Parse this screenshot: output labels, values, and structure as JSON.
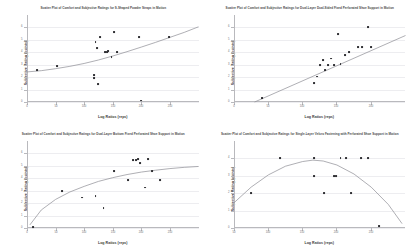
{
  "figure": {
    "layout": "2x2-grid",
    "background_color": "#ffffff",
    "marker_color": "#2f2f33",
    "curve_color": "#8d8d93",
    "gridline_color": "#ededf0",
    "axis_color": "#b9b9bd"
  },
  "chart_data": [
    {
      "type": "scatter",
      "panel": "top-left",
      "title": "Scatter Plot of Comfort and Subjective Ratings for S-Shaped Powder Straps in Motion",
      "xlabel": "Log Ratios (reps)",
      "ylabel": "Subjective Rating (points)",
      "xlim": [
        0,
        300
      ],
      "ylim": [
        0,
        7
      ],
      "xticks": [
        0,
        50,
        100,
        150,
        200,
        250
      ],
      "xticklabels": [
        "0",
        "50",
        "100",
        "150",
        "200",
        "250"
      ],
      "yticks": [
        0,
        1,
        2,
        3,
        4,
        5,
        6
      ],
      "yticklabels": [
        "0",
        "1",
        "2",
        "3",
        "4",
        "5",
        "6"
      ],
      "grid": true,
      "legend": "none",
      "x": [
        18,
        52,
        118,
        118,
        120,
        122,
        124,
        128,
        136,
        140,
        142,
        148,
        152,
        158,
        196,
        200,
        248
      ],
      "y": [
        2.55,
        2.9,
        2.2,
        1.9,
        4.8,
        4.35,
        1.45,
        5.2,
        4.05,
        4.05,
        4.1,
        3.65,
        5.6,
        4.05,
        5.25,
        0.12,
        5.25
      ],
      "fit": {
        "kind": "exponential",
        "points": [
          [
            0,
            2.42
          ],
          [
            25,
            2.52
          ],
          [
            50,
            2.68
          ],
          [
            75,
            2.87
          ],
          [
            100,
            3.1
          ],
          [
            125,
            3.38
          ],
          [
            150,
            3.7
          ],
          [
            175,
            4.05
          ],
          [
            200,
            4.42
          ],
          [
            225,
            4.8
          ],
          [
            250,
            5.2
          ],
          [
            275,
            5.6
          ],
          [
            300,
            6.05
          ]
        ]
      }
    },
    {
      "type": "scatter",
      "panel": "top-right",
      "title": "Scatter Plot of Comfort and Subjective Ratings for Dual-Layer Dual-Sided Fixed Perforated Shoe Support in Motion",
      "xlabel": "Log Ratios (reps)",
      "ylabel": "Subjective Rating (points)",
      "xlim": [
        0,
        250
      ],
      "ylim": [
        0,
        7
      ],
      "xticks": [
        0,
        50,
        100,
        150,
        200
      ],
      "xticklabels": [
        "0",
        "50",
        "100",
        "150",
        "200"
      ],
      "yticks": [
        0,
        1,
        2,
        3,
        4,
        5,
        6
      ],
      "yticklabels": [
        "0",
        "1",
        "2",
        "3",
        "4",
        "5",
        "6"
      ],
      "grid": true,
      "legend": "none",
      "x": [
        42,
        118,
        122,
        126,
        130,
        134,
        138,
        142,
        146,
        152,
        156,
        162,
        168,
        182,
        188,
        196,
        200
      ],
      "y": [
        0.35,
        1.55,
        2.05,
        3.0,
        3.35,
        2.6,
        3.0,
        3.5,
        3.0,
        5.45,
        3.05,
        3.75,
        4.05,
        4.4,
        4.45,
        6.0,
        4.45
      ],
      "fit": {
        "kind": "linear",
        "points": [
          [
            30,
            0.0
          ],
          [
            250,
            5.35
          ]
        ]
      }
    },
    {
      "type": "scatter",
      "panel": "bottom-left",
      "title": "Scatter Plot of Comfort and Subjective Ratings for Dual-Layer Bottom Fixed Perforated Shoe Support in Motion",
      "xlabel": "Log Ratios (reps)",
      "ylabel": "Subjective Rating (points)",
      "xlim": [
        0,
        300
      ],
      "ylim": [
        0,
        7
      ],
      "xticks": [
        0,
        50,
        100,
        150,
        200,
        250
      ],
      "xticklabels": [
        "0",
        "50",
        "100",
        "150",
        "200",
        "250"
      ],
      "yticks": [
        0,
        1,
        2,
        3,
        4,
        5,
        6
      ],
      "yticklabels": [
        "0",
        "1",
        "2",
        "3",
        "4",
        "5",
        "6"
      ],
      "grid": true,
      "legend": "none",
      "x": [
        10,
        62,
        96,
        120,
        134,
        152,
        176,
        186,
        190,
        194,
        198,
        206,
        212,
        218,
        232
      ],
      "y": [
        0.1,
        3.0,
        2.45,
        2.6,
        1.6,
        4.6,
        3.85,
        5.5,
        5.5,
        5.55,
        5.2,
        3.25,
        5.55,
        4.6,
        3.85
      ],
      "fit": {
        "kind": "logarithmic",
        "points": [
          [
            5,
            0.25
          ],
          [
            25,
            1.45
          ],
          [
            50,
            2.3
          ],
          [
            75,
            2.9
          ],
          [
            100,
            3.35
          ],
          [
            125,
            3.75
          ],
          [
            150,
            4.05
          ],
          [
            175,
            4.3
          ],
          [
            200,
            4.5
          ],
          [
            225,
            4.65
          ],
          [
            250,
            4.78
          ],
          [
            275,
            4.88
          ],
          [
            300,
            4.95
          ]
        ]
      }
    },
    {
      "type": "scatter",
      "panel": "bottom-right",
      "title": "Scatter Plot of Comfort and Subjective Ratings for Single-Layer Velcro Fastening with Perforated Shoe Support in Motion",
      "xlabel": "Log Ratios (reps)",
      "ylabel": "Subjective Rating (points)",
      "xlim": [
        50,
        300
      ],
      "ylim": [
        0,
        5
      ],
      "xticks": [
        50,
        100,
        150,
        200,
        250
      ],
      "xticklabels": [
        "50",
        "100",
        "150",
        "200",
        "250"
      ],
      "yticks": [
        0,
        1,
        2,
        3,
        4
      ],
      "yticklabels": [
        "0",
        "1",
        "2",
        "3",
        "4"
      ],
      "grid": true,
      "legend": "none",
      "x": [
        75,
        118,
        168,
        168,
        182,
        196,
        200,
        206,
        214,
        222,
        236,
        246,
        262
      ],
      "y": [
        2.0,
        4.0,
        3.0,
        4.0,
        2.0,
        3.0,
        3.0,
        4.0,
        4.0,
        2.0,
        4.0,
        4.0,
        0.1
      ],
      "fit": {
        "kind": "quadratic",
        "points": [
          [
            50,
            1.45
          ],
          [
            75,
            2.35
          ],
          [
            100,
            3.05
          ],
          [
            125,
            3.55
          ],
          [
            150,
            3.82
          ],
          [
            165,
            3.9
          ],
          [
            180,
            3.85
          ],
          [
            200,
            3.62
          ],
          [
            225,
            3.1
          ],
          [
            250,
            2.35
          ],
          [
            275,
            1.35
          ],
          [
            295,
            0.25
          ]
        ]
      }
    }
  ]
}
